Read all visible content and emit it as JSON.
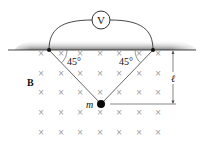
{
  "diagram": {
    "voltmeter": {
      "label": "V"
    },
    "angles": {
      "left": "45°",
      "right": "45°"
    },
    "field": {
      "label": "B",
      "symbol": "×",
      "direction": "into-page"
    },
    "mass": {
      "label": "m"
    },
    "dimension": {
      "label": "ℓ"
    },
    "colors": {
      "line": "#333333",
      "ceiling_shade": "#8a8a8a",
      "cross": "#9a9a9a"
    },
    "grid": {
      "cols_x": [
        41,
        61,
        80,
        100,
        119,
        139,
        158
      ],
      "rows_y": [
        53,
        73,
        92,
        112,
        132
      ]
    }
  }
}
